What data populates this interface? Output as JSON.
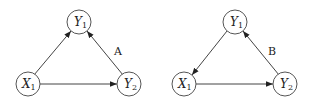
{
  "diagrams": [
    {
      "id": "A",
      "label": "A",
      "nodes": [
        {
          "id": "Y1",
          "var": "Y",
          "sub": "1",
          "x": 79,
          "y": 22
        },
        {
          "id": "X1",
          "var": "X",
          "sub": "1",
          "x": 28,
          "y": 84
        },
        {
          "id": "Y2",
          "var": "Y",
          "sub": "2",
          "x": 129,
          "y": 84
        }
      ],
      "edges": [
        {
          "from": "X1",
          "to": "Y1"
        },
        {
          "from": "Y2",
          "to": "Y1"
        },
        {
          "from": "X1",
          "to": "Y2"
        }
      ]
    },
    {
      "id": "B",
      "label": "B",
      "nodes": [
        {
          "id": "Y1",
          "var": "Y",
          "sub": "1",
          "x": 235,
          "y": 22
        },
        {
          "id": "X1",
          "var": "X",
          "sub": "1",
          "x": 184,
          "y": 84
        },
        {
          "id": "Y2",
          "var": "Y",
          "sub": "2",
          "x": 285,
          "y": 84
        }
      ],
      "edges": [
        {
          "from": "Y1",
          "to": "X1"
        },
        {
          "from": "Y2",
          "to": "Y1"
        },
        {
          "from": "X1",
          "to": "Y2"
        }
      ]
    }
  ]
}
